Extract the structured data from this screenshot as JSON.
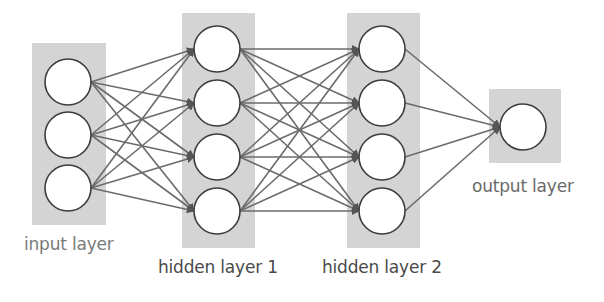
{
  "colors": {
    "layer_box": "#d4d4d4",
    "edge": "#6b6b6b",
    "node_stroke": "#3c3c3c",
    "node_fill": "#ffffff",
    "input_label": "#7a7a7a",
    "hidden_label": "#4a4a4a",
    "output_label": "#6a6a6a"
  },
  "layers": [
    {
      "id": "input",
      "label": "input layer",
      "nodes": 3
    },
    {
      "id": "hidden1",
      "label": "hidden layer 1",
      "nodes": 4
    },
    {
      "id": "hidden2",
      "label": "hidden layer 2",
      "nodes": 4
    },
    {
      "id": "output",
      "label": "output layer",
      "nodes": 1
    }
  ],
  "connections": "fully connected between consecutive layers, arrows pointing right"
}
